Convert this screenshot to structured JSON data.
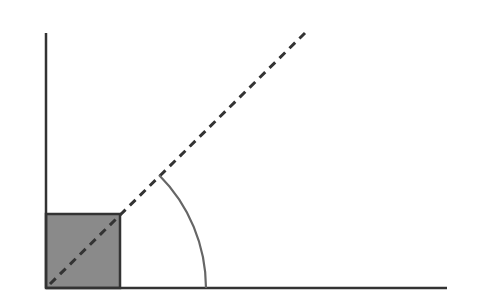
{
  "diagram": {
    "canvas": {
      "width": 478,
      "height": 302,
      "background": "#ffffff"
    },
    "colors": {
      "axis": "#333333",
      "square_fill": "#8a8a8a",
      "square_stroke": "#333333",
      "ray": "#333333",
      "arc": "#666666"
    },
    "origin": {
      "x": 46,
      "y": 288
    },
    "vertical_axis": {
      "x1": 46,
      "y1": 33,
      "x2": 46,
      "y2": 288
    },
    "horizontal_axis": {
      "x1": 46,
      "y1": 288,
      "x2": 447,
      "y2": 288
    },
    "square": {
      "x": 46,
      "y": 214,
      "size": 74
    },
    "dashed_ray": {
      "x1": 50,
      "y1": 284,
      "x2": 305,
      "y2": 33,
      "dash": "8,6"
    },
    "angle_arc": {
      "cx": 46,
      "cy": 288,
      "radius": 160,
      "start_x": 206,
      "start_y": 288,
      "end_x": 159,
      "end_y": 175,
      "angle_deg": 45
    },
    "labels": []
  }
}
